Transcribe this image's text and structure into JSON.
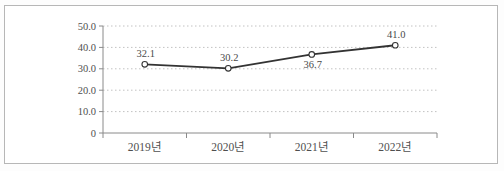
{
  "figure": {
    "kind": "scanned line chart",
    "title": "",
    "border_color": "#b7b7b7",
    "background_color": "#ffffff"
  },
  "chart_data": {
    "type": "line",
    "categories": [
      "2019년",
      "2020년",
      "2021년",
      "2022년"
    ],
    "series": [
      {
        "name": "value",
        "values": [
          32.1,
          30.2,
          36.7,
          41.0
        ],
        "point_labels": [
          "32.1",
          "30.2",
          "36.7",
          "41.0"
        ],
        "point_label_positions": [
          "above",
          "above",
          "below",
          "above"
        ]
      }
    ],
    "xlabel": "",
    "ylabel": "",
    "ylim": [
      0,
      50
    ],
    "y_ticks": [
      {
        "value": 0,
        "label": "0"
      },
      {
        "value": 10,
        "label": "10.0"
      },
      {
        "value": 20,
        "label": "20.0"
      },
      {
        "value": 30,
        "label": "30.0"
      },
      {
        "value": 40,
        "label": "40.0"
      },
      {
        "value": 50,
        "label": "50.0"
      }
    ],
    "grid": "horizontal-dotted",
    "legend": "none",
    "marker": "open-circle",
    "colors": {
      "line": "#333333",
      "marker_fill": "#ffffff",
      "marker_stroke": "#333333",
      "axis": "#8a8a8a",
      "gridline": "#c2c2c2",
      "tick_label": "#4f4f4f",
      "point_label": "#4a4a4a"
    }
  }
}
